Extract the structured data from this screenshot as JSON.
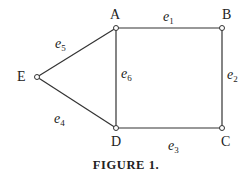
{
  "diagram": {
    "type": "graph",
    "nodes": [
      {
        "id": "A",
        "label": "A",
        "x": 116,
        "y": 28
      },
      {
        "id": "B",
        "label": "B",
        "x": 222,
        "y": 28
      },
      {
        "id": "C",
        "label": "C",
        "x": 222,
        "y": 128
      },
      {
        "id": "D",
        "label": "D",
        "x": 116,
        "y": 128
      },
      {
        "id": "E",
        "label": "E",
        "x": 37,
        "y": 77
      }
    ],
    "edges": [
      {
        "id": "e1",
        "letter": "e",
        "sub": "1",
        "from": "A",
        "to": "B"
      },
      {
        "id": "e2",
        "letter": "e",
        "sub": "2",
        "from": "B",
        "to": "C"
      },
      {
        "id": "e3",
        "letter": "e",
        "sub": "3",
        "from": "D",
        "to": "C"
      },
      {
        "id": "e4",
        "letter": "e",
        "sub": "4",
        "from": "E",
        "to": "D"
      },
      {
        "id": "e5",
        "letter": "e",
        "sub": "5",
        "from": "E",
        "to": "A"
      },
      {
        "id": "e6",
        "letter": "e",
        "sub": "6",
        "from": "A",
        "to": "D"
      }
    ],
    "caption": "FIGURE 1."
  }
}
